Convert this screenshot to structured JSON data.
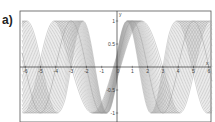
{
  "panel_label": "a)",
  "chart_data": {
    "type": "line",
    "title": "",
    "xlabel": "x",
    "ylabel": "y",
    "xlim": [
      -6.2,
      6.2
    ],
    "ylim": [
      -1.15,
      1.15
    ],
    "x_ticks": [
      -6,
      -5,
      -4,
      -3,
      -2,
      -1,
      0,
      1,
      2,
      3,
      4,
      5,
      6
    ],
    "y_ticks": [
      -1,
      -0.5,
      0,
      0.5,
      1
    ],
    "y_tick_labels": [
      "-1",
      "-0.5",
      "0",
      "0.5",
      "1"
    ],
    "axis_labels": {
      "x": "x",
      "y": "y"
    },
    "grid": false,
    "legend": null,
    "series_shifts": [
      0,
      0.1,
      0.2,
      0.3,
      0.4,
      0.5,
      0.6,
      0.7,
      0.8,
      0.9,
      1.0,
      1.1
    ],
    "line_color": "#9a9a9a"
  },
  "colors": {
    "axis": "#333333",
    "frame": "#555555",
    "curve": "#9a9a9a"
  }
}
